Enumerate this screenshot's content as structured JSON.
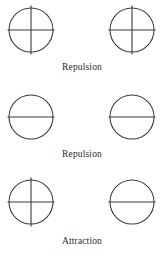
{
  "figure": {
    "background_color": "#ffffff",
    "stroke_color": "#3a3a3a",
    "text_color": "#2b2b2b",
    "rows": [
      {
        "id": "row-1",
        "caption": "Repulsion",
        "left_shape": {
          "name": "circle-with-vertical-and-horizontal-line",
          "has_horizontal_line": true,
          "has_vertical_line": true
        },
        "right_shape": {
          "name": "circle-with-vertical-and-horizontal-line",
          "has_horizontal_line": true,
          "has_vertical_line": true
        }
      },
      {
        "id": "row-2",
        "caption": "Repulsion",
        "left_shape": {
          "name": "circle-with-horizontal-line",
          "has_horizontal_line": true,
          "has_vertical_line": false
        },
        "right_shape": {
          "name": "circle-with-horizontal-line",
          "has_horizontal_line": true,
          "has_vertical_line": false
        }
      },
      {
        "id": "row-3",
        "caption": "Attraction",
        "left_shape": {
          "name": "circle-with-vertical-and-horizontal-line",
          "has_horizontal_line": true,
          "has_vertical_line": true
        },
        "right_shape": {
          "name": "circle-with-horizontal-line",
          "has_horizontal_line": true,
          "has_vertical_line": false
        }
      }
    ]
  }
}
